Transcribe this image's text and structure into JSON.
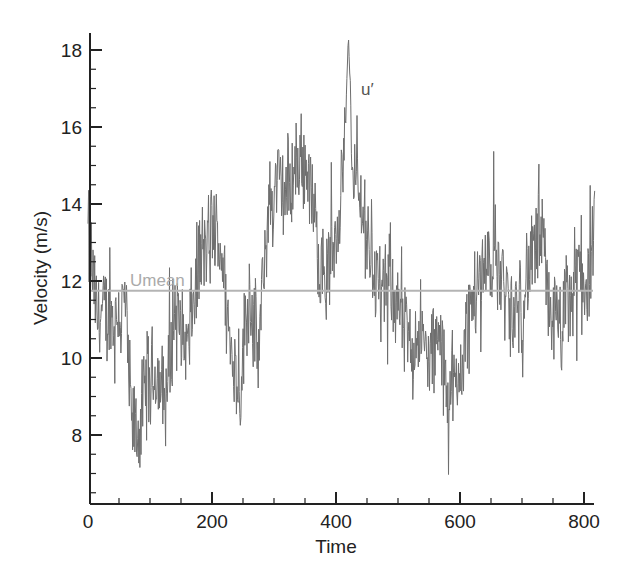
{
  "chart_data": {
    "type": "line",
    "title": "",
    "xlabel": "Time",
    "ylabel": "Velocity (m/s)",
    "xlim": [
      0,
      820
    ],
    "ylim": [
      6.2,
      18.45
    ],
    "xticks": [
      0,
      200,
      400,
      600,
      800
    ],
    "xtick_labels": [
      "0",
      "200",
      "400",
      "600",
      "800"
    ],
    "yticks": [
      8,
      10,
      12,
      14,
      16,
      18
    ],
    "ytick_labels": [
      "8",
      "10",
      "12",
      "14",
      "16",
      "18"
    ],
    "grid": false,
    "legend": "none",
    "annotations": [
      {
        "text": "Umean",
        "x": 75,
        "y": 11.95,
        "color": "#aaaaaa"
      },
      {
        "text": "u′",
        "x": 475,
        "y": 17.0,
        "color": "#555555"
      }
    ],
    "series": [
      {
        "name": "u′",
        "color": "#6e6e6e",
        "trend_x": [
          0,
          5,
          15,
          30,
          45,
          60,
          70,
          80,
          95,
          110,
          125,
          140,
          160,
          180,
          200,
          215,
          230,
          245,
          260,
          275,
          290,
          305,
          320,
          340,
          355,
          370,
          385,
          400,
          410,
          420,
          430,
          445,
          460,
          475,
          490,
          505,
          520,
          535,
          550,
          565,
          580,
          595,
          610,
          625,
          640,
          655,
          670,
          685,
          700,
          715,
          730,
          745,
          760,
          775,
          790,
          805,
          818
        ],
        "trend_y": [
          13.2,
          12.5,
          11.0,
          11.2,
          11.0,
          11.5,
          8.3,
          7.9,
          9.3,
          9.6,
          8.8,
          11.3,
          10.2,
          12.6,
          13.2,
          12.9,
          10.2,
          9.3,
          11.8,
          10.0,
          13.7,
          14.6,
          14.2,
          15.2,
          14.9,
          13.0,
          12.0,
          13.4,
          14.8,
          16.6,
          14.7,
          13.6,
          12.4,
          11.5,
          12.2,
          11.0,
          10.2,
          10.8,
          9.8,
          10.5,
          9.3,
          9.0,
          10.8,
          11.7,
          12.4,
          12.8,
          12.0,
          10.8,
          11.6,
          12.6,
          13.1,
          11.4,
          10.6,
          11.3,
          12.4,
          11.9,
          13.0
        ],
        "fluctuation_amplitude": 1.6,
        "min": 6.3,
        "max": 18.4
      },
      {
        "name": "Umean",
        "color": "#b4b4b4",
        "x": [
          0,
          820
        ],
        "values": [
          11.75,
          11.75
        ]
      }
    ]
  }
}
